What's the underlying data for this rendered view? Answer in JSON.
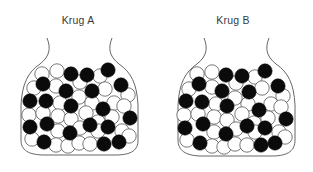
{
  "figure": {
    "jars": [
      {
        "id": "A",
        "label": "Krug A",
        "balls": [
          {
            "x": 42,
            "y": 74,
            "c": "w"
          },
          {
            "x": 57,
            "y": 71,
            "c": "w"
          },
          {
            "x": 71,
            "y": 74,
            "c": "b"
          },
          {
            "x": 87,
            "y": 75,
            "c": "b"
          },
          {
            "x": 100,
            "y": 76,
            "c": "w"
          },
          {
            "x": 108,
            "y": 70,
            "c": "b"
          },
          {
            "x": 34,
            "y": 88,
            "c": "w"
          },
          {
            "x": 43,
            "y": 84,
            "c": "b"
          },
          {
            "x": 56,
            "y": 86,
            "c": "w"
          },
          {
            "x": 66,
            "y": 91,
            "c": "b"
          },
          {
            "x": 80,
            "y": 82,
            "c": "w"
          },
          {
            "x": 92,
            "y": 91,
            "c": "b"
          },
          {
            "x": 105,
            "y": 89,
            "c": "w"
          },
          {
            "x": 121,
            "y": 85,
            "c": "b"
          },
          {
            "x": 128,
            "y": 95,
            "c": "w"
          },
          {
            "x": 30,
            "y": 101,
            "c": "b"
          },
          {
            "x": 46,
            "y": 101,
            "c": "b"
          },
          {
            "x": 60,
            "y": 103,
            "c": "w"
          },
          {
            "x": 71,
            "y": 106,
            "c": "b"
          },
          {
            "x": 79,
            "y": 97,
            "c": "w"
          },
          {
            "x": 92,
            "y": 103,
            "c": "w"
          },
          {
            "x": 103,
            "y": 109,
            "c": "b"
          },
          {
            "x": 114,
            "y": 103,
            "c": "w"
          },
          {
            "x": 124,
            "y": 106,
            "c": "w"
          },
          {
            "x": 29,
            "y": 115,
            "c": "w"
          },
          {
            "x": 43,
            "y": 113,
            "c": "w"
          },
          {
            "x": 58,
            "y": 116,
            "c": "w"
          },
          {
            "x": 71,
            "y": 119,
            "c": "w"
          },
          {
            "x": 86,
            "y": 113,
            "c": "w"
          },
          {
            "x": 98,
            "y": 122,
            "c": "w"
          },
          {
            "x": 112,
            "y": 117,
            "c": "w"
          },
          {
            "x": 130,
            "y": 118,
            "c": "b"
          },
          {
            "x": 30,
            "y": 127,
            "c": "b"
          },
          {
            "x": 47,
            "y": 124,
            "c": "b"
          },
          {
            "x": 58,
            "y": 131,
            "c": "w"
          },
          {
            "x": 70,
            "y": 133,
            "c": "b"
          },
          {
            "x": 80,
            "y": 128,
            "c": "w"
          },
          {
            "x": 90,
            "y": 125,
            "c": "b"
          },
          {
            "x": 98,
            "y": 131,
            "c": "w"
          },
          {
            "x": 108,
            "y": 127,
            "c": "b"
          },
          {
            "x": 122,
            "y": 131,
            "c": "w"
          },
          {
            "x": 32,
            "y": 139,
            "c": "w"
          },
          {
            "x": 44,
            "y": 142,
            "c": "b"
          },
          {
            "x": 56,
            "y": 145,
            "c": "w"
          },
          {
            "x": 68,
            "y": 146,
            "c": "w"
          },
          {
            "x": 79,
            "y": 143,
            "c": "w"
          },
          {
            "x": 90,
            "y": 144,
            "c": "w"
          },
          {
            "x": 104,
            "y": 144,
            "c": "b"
          },
          {
            "x": 119,
            "y": 142,
            "c": "b"
          },
          {
            "x": 129,
            "y": 136,
            "c": "w"
          }
        ]
      },
      {
        "id": "B",
        "label": "Krug B",
        "balls": [
          {
            "x": 42,
            "y": 74,
            "c": "w"
          },
          {
            "x": 57,
            "y": 72,
            "c": "w"
          },
          {
            "x": 71,
            "y": 75,
            "c": "b"
          },
          {
            "x": 87,
            "y": 76,
            "c": "b"
          },
          {
            "x": 100,
            "y": 77,
            "c": "w"
          },
          {
            "x": 110,
            "y": 71,
            "c": "b"
          },
          {
            "x": 34,
            "y": 89,
            "c": "w"
          },
          {
            "x": 44,
            "y": 84,
            "c": "b"
          },
          {
            "x": 57,
            "y": 87,
            "c": "w"
          },
          {
            "x": 67,
            "y": 91,
            "c": "b"
          },
          {
            "x": 81,
            "y": 83,
            "c": "w"
          },
          {
            "x": 94,
            "y": 92,
            "c": "b"
          },
          {
            "x": 107,
            "y": 88,
            "c": "w"
          },
          {
            "x": 123,
            "y": 86,
            "c": "b"
          },
          {
            "x": 128,
            "y": 96,
            "c": "w"
          },
          {
            "x": 31,
            "y": 101,
            "c": "b"
          },
          {
            "x": 47,
            "y": 102,
            "c": "b"
          },
          {
            "x": 61,
            "y": 104,
            "c": "w"
          },
          {
            "x": 72,
            "y": 106,
            "c": "b"
          },
          {
            "x": 80,
            "y": 98,
            "c": "w"
          },
          {
            "x": 93,
            "y": 104,
            "c": "w"
          },
          {
            "x": 104,
            "y": 110,
            "c": "b"
          },
          {
            "x": 116,
            "y": 104,
            "c": "w"
          },
          {
            "x": 126,
            "y": 107,
            "c": "w"
          },
          {
            "x": 29,
            "y": 115,
            "c": "w"
          },
          {
            "x": 43,
            "y": 114,
            "c": "w"
          },
          {
            "x": 59,
            "y": 117,
            "c": "w"
          },
          {
            "x": 72,
            "y": 120,
            "c": "w"
          },
          {
            "x": 87,
            "y": 114,
            "c": "w"
          },
          {
            "x": 99,
            "y": 123,
            "c": "w"
          },
          {
            "x": 113,
            "y": 118,
            "c": "w"
          },
          {
            "x": 131,
            "y": 119,
            "c": "b"
          },
          {
            "x": 30,
            "y": 128,
            "c": "b"
          },
          {
            "x": 48,
            "y": 124,
            "c": "b"
          },
          {
            "x": 59,
            "y": 132,
            "c": "w"
          },
          {
            "x": 71,
            "y": 134,
            "c": "b"
          },
          {
            "x": 81,
            "y": 129,
            "c": "w"
          },
          {
            "x": 92,
            "y": 126,
            "c": "b"
          },
          {
            "x": 100,
            "y": 132,
            "c": "w"
          },
          {
            "x": 110,
            "y": 128,
            "c": "b"
          },
          {
            "x": 124,
            "y": 132,
            "c": "w"
          },
          {
            "x": 32,
            "y": 140,
            "c": "w"
          },
          {
            "x": 45,
            "y": 143,
            "c": "b"
          },
          {
            "x": 57,
            "y": 146,
            "c": "w"
          },
          {
            "x": 69,
            "y": 147,
            "c": "w"
          },
          {
            "x": 80,
            "y": 144,
            "c": "w"
          },
          {
            "x": 92,
            "y": 145,
            "c": "w"
          },
          {
            "x": 106,
            "y": 145,
            "c": "b"
          },
          {
            "x": 120,
            "y": 143,
            "c": "b"
          },
          {
            "x": 130,
            "y": 137,
            "c": "w"
          }
        ]
      }
    ],
    "colors": {
      "black_ball": "#0b0b0b",
      "white_ball": "#ffffff",
      "outline": "#555555",
      "label": "#3a3a3a"
    },
    "ball_radius": 7.2
  }
}
